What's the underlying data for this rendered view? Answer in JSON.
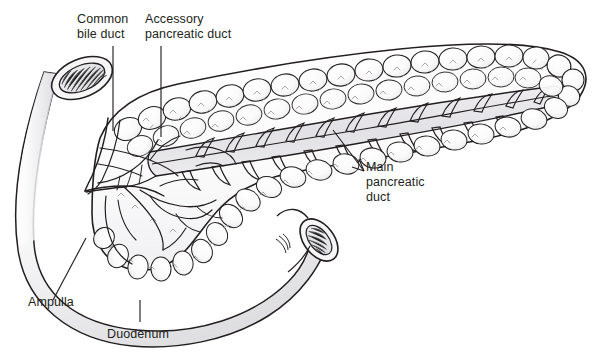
{
  "figure": {
    "type": "anatomical-line-illustration",
    "width": 603,
    "height": 364,
    "background_color": "#ffffff",
    "ink_color": "#231f20",
    "fill_light": "#fdfdfd",
    "fill_shadow": "#e3e3e5",
    "stipple_color": "#8a8a92"
  },
  "labels": {
    "common_bile_duct": "Common\nbile duct",
    "accessory_pancreatic_duct": "Accessory\npancreatic duct",
    "main_pancreatic_duct": "Main\npancreatic\nduct",
    "ampulla": "Ampulla",
    "duodenum": "Duodenum"
  },
  "structures": [
    {
      "name": "duodenum",
      "description": "C-shaped tube with two cut ends showing striated mucosal folds"
    },
    {
      "name": "pancreas",
      "description": "Lobulated gland, head at left nestled in duodenal curve, body and tail extending to upper right"
    },
    {
      "name": "main-pancreatic-duct",
      "description": "Central duct with herringbone side branches, dissected open along body and tail"
    },
    {
      "name": "accessory-pancreatic-duct",
      "description": "Smaller duct in the pancreatic head entering duodenum superiorly"
    },
    {
      "name": "common-bile-duct",
      "description": "Duct descending through pancreatic head to join the ampulla"
    },
    {
      "name": "ampulla",
      "description": "Confluence of common bile duct and main pancreatic duct entering the duodenal wall"
    }
  ],
  "leader_lines": [
    {
      "name": "common-bile-duct-leader",
      "orientation": "vertical",
      "from": [
        113,
        46
      ],
      "to": [
        113,
        131
      ]
    },
    {
      "name": "accessory-duct-leader",
      "orientation": "vertical",
      "from": [
        161,
        46
      ],
      "to": [
        161,
        137
      ]
    },
    {
      "name": "main-duct-leader",
      "orientation": "diagonal",
      "from": [
        333,
        130
      ],
      "to": [
        364,
        171
      ],
      "arrow": true
    },
    {
      "name": "ampulla-leader",
      "orientation": "diagonal",
      "from": [
        53,
        300
      ],
      "to": [
        86,
        238
      ]
    },
    {
      "name": "duodenum-leader",
      "orientation": "vertical",
      "from": [
        140,
        300
      ],
      "to": [
        140,
        322
      ]
    }
  ]
}
